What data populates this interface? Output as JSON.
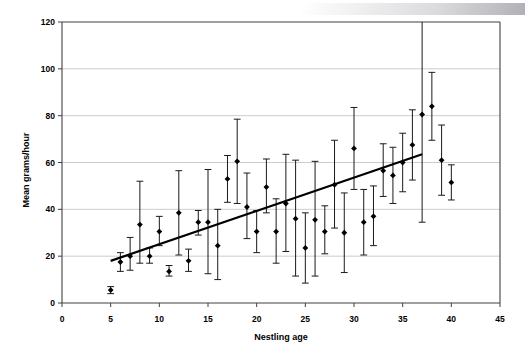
{
  "chart_data": {
    "type": "scatter",
    "title": "",
    "xlabel": "Nestling age",
    "ylabel": "Mean grams/hour",
    "xlim": [
      0,
      45
    ],
    "ylim": [
      0,
      120
    ],
    "xticks": [
      0,
      5,
      10,
      15,
      20,
      25,
      30,
      35,
      40,
      45
    ],
    "yticks": [
      0,
      20,
      40,
      60,
      80,
      100,
      120
    ],
    "grid": "horizontal",
    "legend": "none",
    "marker": "filled-diamond",
    "errorbar_style": "vertical-with-caps",
    "series": [
      {
        "name": "Mean grams/hour",
        "x": [
          5,
          6,
          7,
          8,
          9,
          10,
          11,
          12,
          13,
          14,
          15,
          16,
          17,
          18,
          19,
          20,
          21,
          22,
          23,
          24,
          25,
          26,
          27,
          28,
          29,
          30,
          31,
          32,
          33,
          34,
          35,
          36,
          37,
          38,
          39,
          40
        ],
        "y": [
          5.5,
          17.5,
          20.0,
          33.5,
          20.0,
          30.5,
          13.5,
          38.5,
          18.0,
          34.5,
          34.5,
          24.5,
          53.0,
          60.5,
          41.0,
          30.5,
          49.5,
          30.5,
          42.5,
          36.0,
          23.5,
          35.5,
          30.5,
          50.5,
          30.0,
          66.0,
          34.5,
          37.0,
          56.5,
          54.5,
          60.0,
          67.5,
          80.5,
          84.0,
          61.0,
          51.5
        ],
        "err_low": [
          4.0,
          13.5,
          14.0,
          17.0,
          17.0,
          24.5,
          11.5,
          20.5,
          13.5,
          29.0,
          12.5,
          10.0,
          43.0,
          42.5,
          27.5,
          21.5,
          38.5,
          17.0,
          22.0,
          11.5,
          8.5,
          11.5,
          21.0,
          32.0,
          13.0,
          48.5,
          20.5,
          24.5,
          45.5,
          42.5,
          47.5,
          52.5,
          34.5,
          69.5,
          46.0,
          44.0
        ],
        "err_high": [
          7.0,
          21.5,
          28.0,
          52.0,
          23.5,
          37.0,
          16.0,
          56.5,
          23.0,
          39.5,
          57.0,
          40.0,
          63.0,
          78.5,
          55.5,
          39.5,
          61.5,
          44.5,
          63.5,
          61.0,
          38.5,
          60.5,
          41.5,
          69.5,
          47.0,
          83.5,
          48.5,
          50.0,
          68.0,
          66.5,
          72.5,
          82.5,
          122.0,
          98.5,
          76.0,
          59.0
        ]
      }
    ],
    "trendline": {
      "name": "linear-fit",
      "x_start": 5,
      "y_start": 18.0,
      "x_end": 37,
      "y_end": 63.5
    }
  }
}
